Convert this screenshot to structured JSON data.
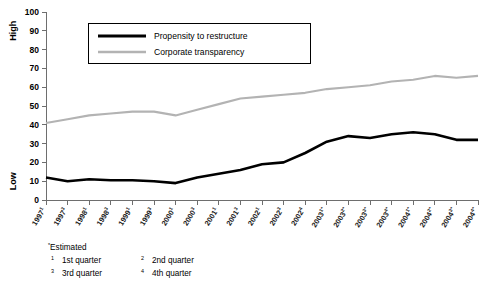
{
  "chart_data": {
    "type": "line",
    "title": "",
    "xlabel": "",
    "ylabel": "",
    "ylim": [
      0,
      100
    ],
    "ytick_step": 10,
    "grid": false,
    "legend_position": "top-center",
    "y_axis_top_label": "High",
    "y_axis_bottom_label": "Low",
    "ytick_labels": [
      "0",
      "10",
      "20",
      "30",
      "40",
      "50",
      "60",
      "70",
      "80",
      "90",
      "100"
    ],
    "categories": [
      "1997¹",
      "1997³",
      "1998¹",
      "1998³",
      "1999¹",
      "1999³",
      "2000¹",
      "2000³",
      "2001¹",
      "2001³",
      "2002¹",
      "2002³",
      "2002⁴",
      "2003¹*",
      "2003²*",
      "2003³*",
      "2003⁴*",
      "2004¹*",
      "2004²*",
      "2004³*",
      "2004⁴*"
    ],
    "category_parts": [
      {
        "base": "1997",
        "sup": "1"
      },
      {
        "base": "1997",
        "sup": "3"
      },
      {
        "base": "1998",
        "sup": "1"
      },
      {
        "base": "1998",
        "sup": "3"
      },
      {
        "base": "1999",
        "sup": "1"
      },
      {
        "base": "1999",
        "sup": "3"
      },
      {
        "base": "2000",
        "sup": "1"
      },
      {
        "base": "2000",
        "sup": "3"
      },
      {
        "base": "2001",
        "sup": "1"
      },
      {
        "base": "2001",
        "sup": "3"
      },
      {
        "base": "2002",
        "sup": "1"
      },
      {
        "base": "2002",
        "sup": "3"
      },
      {
        "base": "2002",
        "sup": "4"
      },
      {
        "base": "2003",
        "sup": "1*"
      },
      {
        "base": "2003",
        "sup": "2*"
      },
      {
        "base": "2003",
        "sup": "3*"
      },
      {
        "base": "2003",
        "sup": "4*"
      },
      {
        "base": "2004",
        "sup": "1*"
      },
      {
        "base": "2004",
        "sup": "2*"
      },
      {
        "base": "2004",
        "sup": "3*"
      },
      {
        "base": "2004",
        "sup": "4*"
      }
    ],
    "series": [
      {
        "name": "Propensity to restructure",
        "color": "#000000",
        "values": [
          12,
          10,
          11,
          10.5,
          10.5,
          10,
          9,
          12,
          14,
          16,
          19,
          20,
          25,
          31,
          34,
          33,
          35,
          36,
          35,
          32,
          32
        ]
      },
      {
        "name": "Corporate transparency",
        "color": "#b3b3b3",
        "values": [
          41,
          43,
          45,
          46,
          47,
          47,
          45,
          48,
          51,
          54,
          55,
          56,
          57,
          59,
          60,
          61,
          63,
          64,
          66,
          65,
          66
        ]
      }
    ]
  },
  "legend": {
    "entries": [
      {
        "label": "Propensity to restructure",
        "color": "#000000"
      },
      {
        "label": "Corporate transparency",
        "color": "#b3b3b3"
      }
    ]
  },
  "footnotes": {
    "estimated": {
      "marker": "*",
      "text": "Estimated"
    },
    "items": [
      {
        "marker": "1",
        "text": "1st quarter"
      },
      {
        "marker": "3",
        "text": "3rd quarter"
      },
      {
        "marker": "2",
        "text": "2nd quarter"
      },
      {
        "marker": "4",
        "text": "4th quarter"
      }
    ]
  }
}
